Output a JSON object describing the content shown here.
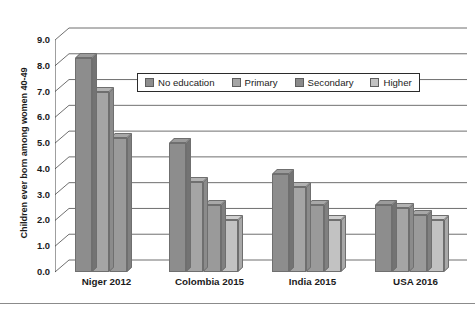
{
  "chart_data": {
    "type": "bar",
    "title": "",
    "xlabel": "",
    "ylabel": "Children ever born among women 40-49",
    "ylim": [
      0,
      9
    ],
    "ytick_step": 1,
    "ytick_labels": [
      "9.0",
      "8.0",
      "7.0",
      "6.0",
      "5.0",
      "4.0",
      "3.0",
      "2.0",
      "1.0",
      "0.0"
    ],
    "grid": true,
    "legend_position": "upper-center",
    "style": "3d-grouped-bar-grayscale",
    "categories": [
      "Niger 2012",
      "Colombia 2015",
      "India 2015",
      "USA 2016"
    ],
    "series": [
      {
        "name": "No education",
        "color": "#8d8d8d",
        "values": [
          8.3,
          5.0,
          3.8,
          2.6
        ]
      },
      {
        "name": "Primary",
        "color": "#a5a5a5",
        "values": [
          7.0,
          3.5,
          3.3,
          2.5
        ]
      },
      {
        "name": "Secondary",
        "color": "#9a9a9a",
        "values": [
          5.2,
          2.6,
          2.6,
          2.2
        ]
      },
      {
        "name": "Higher",
        "color": "#c2c2c2",
        "values": [
          null,
          2.0,
          2.0,
          2.0
        ]
      }
    ]
  },
  "legend": {
    "items": [
      {
        "label": "No education",
        "color": "#8d8d8d"
      },
      {
        "label": "Primary",
        "color": "#a5a5a5"
      },
      {
        "label": "Secondary",
        "color": "#8a8a8a"
      },
      {
        "label": "Higher",
        "color": "#c2c2c2"
      }
    ]
  },
  "caption": {
    "text": ""
  },
  "colors": {
    "axis": "#2b2b2b",
    "grid": "#4a4a4a",
    "background": "#ffffff",
    "bar_outline": "#6f6f6f"
  }
}
